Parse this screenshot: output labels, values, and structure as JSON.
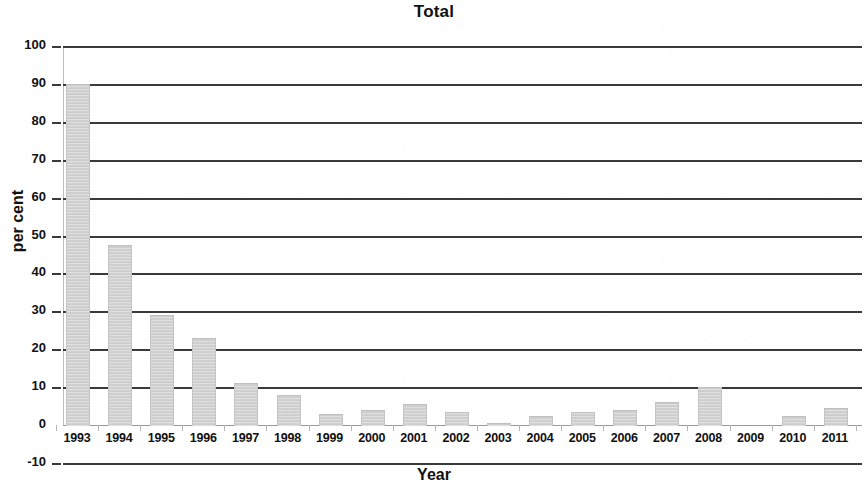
{
  "chart_data": {
    "type": "bar",
    "title": "Total",
    "xlabel": "Year",
    "ylabel": "per cent",
    "categories": [
      "1993",
      "1994",
      "1995",
      "1996",
      "1997",
      "1998",
      "1999",
      "2000",
      "2001",
      "2002",
      "2003",
      "2004",
      "2005",
      "2006",
      "2007",
      "2008",
      "2009",
      "2010",
      "2011"
    ],
    "values": [
      90,
      47.5,
      29,
      23,
      11,
      8,
      3,
      4,
      5.5,
      3.5,
      0.5,
      2.5,
      3.5,
      4,
      6,
      10,
      0,
      2.5,
      4.5
    ],
    "ylim": [
      -10,
      100
    ],
    "ytick_labels": [
      "100",
      "90",
      "80",
      "70",
      "60",
      "50",
      "40",
      "30",
      "20",
      "10",
      "0",
      "-10"
    ],
    "ytick_values": [
      100,
      90,
      80,
      70,
      60,
      50,
      40,
      30,
      20,
      10,
      0,
      -10
    ],
    "grid": true,
    "grid_axis": "y",
    "legend": "none",
    "series_color": "#d2d2d2",
    "gridline_color": "#3a3a3a",
    "text_color": "#111111",
    "background": "#ffffff"
  }
}
